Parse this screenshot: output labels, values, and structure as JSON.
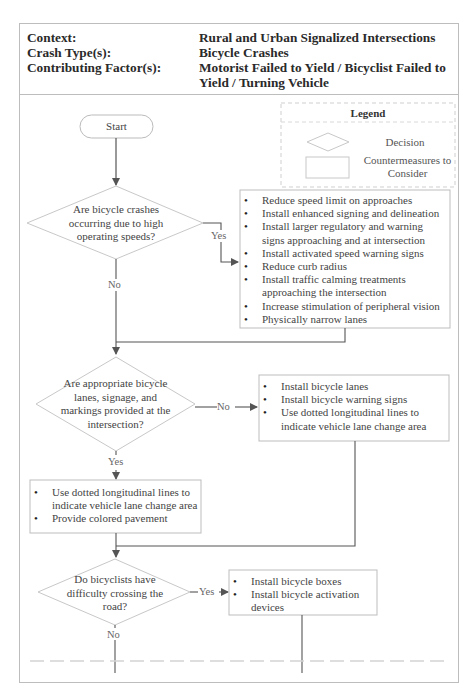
{
  "header": {
    "rows": [
      {
        "label": "Context:",
        "value": "Rural and Urban Signalized Intersections"
      },
      {
        "label": "Crash Type(s):",
        "value": "Bicycle Crashes"
      },
      {
        "label": "Contributing Factor(s):",
        "value": "Motorist Failed to Yield / Bicyclist Failed to Yield / Turning Vehicle"
      }
    ]
  },
  "legend": {
    "title": "Legend",
    "decision_label": "Decision",
    "countermeasures_label": "Countermeasures to Consider"
  },
  "flow": {
    "start_label": "Start",
    "decisions": [
      {
        "question": "Are bicycle crashes occurring due to high operating speeds?",
        "yes_label": "Yes",
        "no_label": "No"
      },
      {
        "question": "Are appropriate bicycle lanes, signage, and markings provided at the intersection?",
        "yes_label": "Yes",
        "no_label": "No"
      },
      {
        "question": "Do bicyclists have difficulty crossing the road?",
        "yes_label": "Yes",
        "no_label": "No"
      }
    ],
    "countermeasures": [
      {
        "items": [
          "Reduce speed limit on approaches",
          "Install enhanced signing and delineation",
          "Install larger regulatory and warning signs approaching and at intersection",
          "Install activated speed warning signs",
          "Reduce curb radius",
          "Install traffic calming treatments approaching the intersection",
          "Increase stimulation of peripheral vision",
          "Physically narrow lanes"
        ]
      },
      {
        "items": [
          "Install bicycle lanes",
          "Install bicycle warning signs",
          "Use dotted longitudinal lines to indicate vehicle lane change area"
        ]
      },
      {
        "items": [
          "Use dotted longitudinal lines to indicate vehicle lane change area",
          "Provide colored pavement"
        ]
      },
      {
        "items": [
          "Install bicycle boxes",
          "Install bicycle activation devices"
        ]
      }
    ]
  }
}
